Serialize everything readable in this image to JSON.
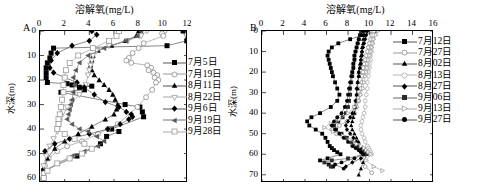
{
  "figure": {
    "background": "#ffffff",
    "axis_color": "#000000"
  },
  "panels": [
    {
      "id": "A",
      "letter": "A",
      "title": "溶解氧(mg/L)",
      "xlabel": "",
      "ylabel": "水深(m)",
      "xticks": [
        0,
        2,
        4,
        6,
        8,
        10,
        12
      ],
      "yticks": [
        0,
        10,
        20,
        30,
        40,
        50,
        60
      ],
      "xlim": [
        0,
        12
      ],
      "ylim": [
        0,
        62
      ],
      "legend_labels": [
        "7月5日",
        "7月19日",
        "8月11日",
        "8月22日",
        "9月6日",
        "9月19日",
        "9月28日"
      ]
    },
    {
      "id": "B",
      "letter": "B",
      "title": "溶解氧(mg/L)",
      "xlabel": "",
      "ylabel": "水深(m)",
      "xticks": [
        0,
        2,
        4,
        6,
        8,
        10,
        12,
        14,
        16
      ],
      "yticks": [
        0,
        10,
        20,
        30,
        40,
        50,
        60,
        70
      ],
      "xlim": [
        0,
        16
      ],
      "ylim": [
        0,
        74
      ],
      "legend_labels": [
        "7月12日",
        "7月27日",
        "8月02日",
        "8月13日",
        "8月27日",
        "9月06日",
        "9月13日",
        "9月27日"
      ]
    }
  ],
  "chart_data": [
    {
      "type": "line",
      "panel": "A",
      "title": "溶解氧(mg/L)",
      "xlabel": "溶解氧(mg/L)",
      "ylabel": "水深(m)",
      "xlim": [
        0,
        12
      ],
      "ylim": [
        0,
        62
      ],
      "y_inverted": true,
      "grid": false,
      "legend_position": "right-inside",
      "series": [
        {
          "name": "7月5日",
          "marker": "filled-square",
          "color": "#000000",
          "line_color": "#555555",
          "x": [
            11.6,
            11.9,
            10.3,
            1.1,
            0.9,
            0.8,
            0.6,
            0.5,
            0.5,
            0.5,
            0.6,
            2.2,
            2.6,
            4.2,
            3.2,
            3.6,
            1.7,
            6.9,
            8.1,
            8.3,
            8.4,
            5.8,
            6.4,
            5.4,
            4.9,
            3.0,
            0.3,
            0.3
          ],
          "y": [
            0,
            4,
            6,
            7,
            9,
            11,
            13,
            15,
            17,
            19,
            21,
            21.5,
            22,
            22.5,
            23,
            24,
            25,
            30,
            31,
            33,
            35,
            40,
            41,
            43,
            46,
            51,
            57,
            60
          ]
        },
        {
          "name": "7月19日",
          "marker": "open-circle",
          "color": "#8a8a8a",
          "line_color": "#9a9a9a",
          "x": [
            10.1,
            9.9,
            10.0,
            8.4,
            8.0,
            7.5,
            7.2,
            7.0,
            7.4,
            8.7,
            9.0,
            8.8,
            9.2,
            9.5,
            9.3,
            9.6,
            9.4,
            9.1,
            8.6,
            7.9,
            6.3,
            5.5,
            4.7,
            3.4,
            2.2,
            1.4,
            0.7,
            0.4,
            0.3
          ],
          "y": [
            0,
            1,
            2,
            5,
            7,
            9,
            11,
            12,
            13,
            14,
            15,
            16,
            17,
            18,
            19,
            20,
            21,
            24,
            27,
            31,
            38,
            40,
            42,
            45,
            47,
            49,
            52,
            55,
            58
          ]
        },
        {
          "name": "8月11日",
          "marker": "filled-triangle",
          "color": "#000000",
          "line_color": "#555555",
          "x": [
            8.0,
            7.8,
            6.9,
            5.8,
            4.7,
            4.3,
            4.2,
            4.1,
            4.2,
            4.4,
            4.8,
            5.2,
            5.6,
            5.9,
            6.1,
            6.3,
            6.2,
            6.0,
            5.3,
            4.2,
            3.1,
            2.0,
            1.2,
            0.6,
            0.3
          ],
          "y": [
            0,
            2,
            4,
            6,
            8,
            10,
            12,
            14,
            16,
            18,
            20,
            22,
            24,
            26,
            28,
            30,
            32,
            34,
            36,
            39,
            42,
            45,
            48,
            52,
            56
          ]
        },
        {
          "name": "8月22日",
          "marker": "open-triangle-down",
          "color": "#9a9a9a",
          "line_color": "#a5a5a5",
          "x": [
            8.7,
            8.2,
            7.1,
            5.6,
            4.6,
            4.3,
            4.2,
            4.1,
            4.0,
            3.9,
            3.7,
            3.2,
            2.6,
            2.2,
            1.9,
            1.7,
            1.6,
            1.5,
            1.4,
            1.1,
            0.8,
            0.5,
            0.3
          ],
          "y": [
            0,
            2,
            4,
            6,
            8,
            10,
            12,
            14,
            16,
            18,
            22,
            26,
            29,
            31,
            33,
            35,
            37,
            39,
            41,
            44,
            47,
            51,
            55
          ]
        },
        {
          "name": "9月6日",
          "marker": "filled-diamond",
          "color": "#000000",
          "line_color": "#555555",
          "x": [
            4.2,
            4.6,
            4.0,
            2.6,
            1.4,
            0.9,
            0.8,
            1.1,
            2.0,
            3.0,
            3.6,
            4.4,
            5.3,
            6.4,
            7.0,
            7.4,
            7.5,
            7.2,
            6.5,
            5.5,
            4.0,
            2.4,
            1.2,
            0.4
          ],
          "y": [
            0,
            1.5,
            4,
            6,
            9,
            12,
            15,
            17,
            19,
            21,
            23,
            26,
            29,
            31,
            33,
            34,
            35,
            36,
            38,
            40,
            42,
            44,
            46,
            49
          ]
        },
        {
          "name": "9月19日",
          "marker": "filled-triangle-left",
          "color": "#5a5a5a",
          "line_color": "#777777",
          "x": [
            8.2,
            7.9,
            7.0,
            5.2,
            3.9,
            3.2,
            2.9,
            2.7,
            2.8,
            2.7,
            2.6,
            2.5,
            2.4,
            2.3,
            2.2,
            2.6,
            3.2,
            3.9,
            4.6,
            5.2,
            4.7,
            3.6,
            2.6,
            1.4,
            0.5
          ],
          "y": [
            0,
            2,
            4,
            7,
            10,
            13,
            16,
            19,
            22,
            25,
            28,
            30,
            32,
            34,
            36,
            38,
            40,
            41,
            43,
            45,
            47,
            49,
            51,
            54,
            57
          ]
        },
        {
          "name": "9月28日",
          "marker": "open-square",
          "color": "#9a9a9a",
          "line_color": "#a5a5a5",
          "x": [
            6.4,
            6.2,
            5.6,
            4.3,
            3.1,
            2.4,
            2.1,
            2.0,
            1.9,
            1.9,
            1.8,
            1.7,
            1.6,
            1.5,
            1.5,
            1.4,
            2.0,
            2.8,
            3.6,
            4.2,
            3.4,
            2.4,
            1.4,
            0.6,
            0.3
          ],
          "y": [
            0,
            2,
            4,
            7,
            10,
            13,
            16,
            19,
            22,
            25,
            28,
            31,
            34,
            36,
            38,
            40,
            42,
            44,
            46,
            48,
            50,
            52,
            54,
            57,
            60
          ]
        }
      ]
    },
    {
      "type": "line",
      "panel": "B",
      "title": "溶解氧(mg/L)",
      "xlabel": "溶解氧(mg/L)",
      "ylabel": "水深(m)",
      "xlim": [
        0,
        16
      ],
      "ylim": [
        0,
        74
      ],
      "y_inverted": true,
      "grid": false,
      "legend_position": "right-inside",
      "series": [
        {
          "name": "7月12日",
          "marker": "filled-square",
          "color": "#000000",
          "line_color": "#555555",
          "x": [
            10.6,
            9.4,
            8.2,
            7.1,
            6.5,
            6.2,
            6.1,
            6.2,
            6.3,
            6.4,
            6.5,
            6.6,
            6.8,
            7.0,
            7.2,
            7.0,
            6.4,
            5.4,
            4.6,
            4.2,
            4.4,
            5.0,
            5.6,
            5.9,
            6.1,
            6.3,
            6.5,
            6.7,
            7.0,
            7.3,
            6.1,
            5.4,
            6.2,
            6.6
          ],
          "y": [
            0,
            2,
            4,
            6,
            8,
            10,
            12,
            14,
            16,
            18,
            20,
            22,
            25,
            28,
            31,
            34,
            37,
            40,
            42,
            44,
            46,
            48,
            50,
            52,
            54,
            56,
            57,
            58,
            59,
            60,
            62,
            63,
            65,
            66
          ]
        },
        {
          "name": "7月27日",
          "marker": "open-circle",
          "color": "#8a8a8a",
          "line_color": "#9a9a9a",
          "x": [
            10.3,
            10.2,
            10.1,
            10.0,
            9.9,
            9.8,
            9.7,
            9.6,
            9.5,
            9.4,
            9.4,
            9.3,
            9.3,
            9.2,
            9.1,
            9.0,
            8.8,
            8.6,
            8.3,
            7.9,
            7.2,
            6.5,
            6.9,
            7.8,
            8.4,
            8.8,
            9.2,
            9.4,
            9.6,
            9.5,
            9.3,
            9.6,
            10.2
          ],
          "y": [
            0,
            2,
            4,
            6,
            8,
            10,
            12,
            14,
            16,
            18,
            20,
            22,
            25,
            28,
            31,
            34,
            37,
            40,
            42,
            44,
            46,
            48,
            50,
            52,
            54,
            56,
            57,
            58,
            59,
            60,
            63,
            66,
            69
          ]
        },
        {
          "name": "8月02日",
          "marker": "filled-triangle",
          "color": "#000000",
          "line_color": "#555555",
          "x": [
            9.6,
            9.5,
            9.4,
            9.4,
            9.3,
            9.3,
            9.2,
            9.2,
            9.1,
            9.1,
            9.0,
            9.0,
            8.9,
            8.9,
            8.8,
            8.8,
            8.7,
            8.6,
            8.5,
            8.4,
            8.3,
            8.4,
            8.6,
            8.8,
            9.0,
            9.1,
            9.2,
            9.4,
            9.6,
            9.8,
            9.4,
            9.2,
            9.0
          ],
          "y": [
            0,
            2,
            4,
            6,
            8,
            10,
            12,
            14,
            16,
            18,
            20,
            22,
            25,
            28,
            31,
            34,
            37,
            40,
            42,
            44,
            46,
            48,
            50,
            52,
            54,
            56,
            57,
            58,
            59,
            60,
            64,
            67,
            70
          ]
        },
        {
          "name": "8月13日",
          "marker": "open-circle-light",
          "color": "#b0b0b0",
          "line_color": "#b5b5b5",
          "x": [
            10.4,
            10.4,
            10.3,
            10.3,
            10.2,
            10.2,
            10.1,
            10.1,
            10.0,
            10.0,
            9.9,
            9.9,
            9.8,
            9.8,
            9.7,
            9.6,
            9.6,
            9.5,
            9.4,
            9.3,
            9.2,
            9.2,
            9.3,
            9.5,
            9.6,
            9.8,
            9.9,
            10.0,
            10.1,
            10.2
          ],
          "y": [
            0,
            2,
            4,
            6,
            8,
            10,
            12,
            14,
            16,
            18,
            20,
            22,
            25,
            28,
            31,
            34,
            37,
            40,
            42,
            44,
            46,
            48,
            50,
            52,
            54,
            56,
            57,
            58,
            59,
            60
          ]
        },
        {
          "name": "8月27日",
          "marker": "filled-diamond",
          "color": "#000000",
          "line_color": "#555555",
          "x": [
            9.8,
            9.7,
            9.6,
            9.5,
            9.4,
            9.3,
            9.3,
            9.2,
            9.2,
            9.1,
            9.0,
            9.0,
            8.9,
            8.8,
            8.8,
            8.7,
            8.6,
            8.4,
            8.2,
            8.0,
            7.8,
            7.9,
            8.2,
            8.5,
            8.8,
            9.0,
            9.2,
            9.4,
            9.6,
            9.2,
            8.4,
            7.8
          ],
          "y": [
            0,
            2,
            4,
            6,
            8,
            10,
            12,
            14,
            16,
            18,
            20,
            22,
            25,
            28,
            31,
            34,
            37,
            40,
            42,
            44,
            46,
            48,
            50,
            52,
            54,
            56,
            57,
            58,
            60,
            62,
            64,
            66
          ]
        },
        {
          "name": "9月06日",
          "marker": "filled-square-sm",
          "color": "#2a2a2a",
          "line_color": "#666666",
          "x": [
            9.2,
            9.1,
            9.0,
            8.9,
            8.8,
            8.7,
            8.6,
            8.6,
            8.5,
            8.5,
            8.4,
            8.4,
            8.3,
            8.2,
            8.2,
            8.1,
            8.0,
            7.8,
            7.5,
            7.1,
            6.7,
            6.9,
            7.4,
            7.9,
            8.3,
            8.6,
            8.9,
            9.1,
            9.3,
            9.5,
            8.0,
            6.5,
            5.8,
            6.4
          ],
          "y": [
            0,
            2,
            4,
            6,
            8,
            10,
            12,
            14,
            16,
            18,
            20,
            22,
            25,
            28,
            31,
            34,
            37,
            40,
            42,
            44,
            46,
            48,
            50,
            52,
            54,
            56,
            57,
            58,
            59,
            60,
            62,
            63,
            64,
            66
          ]
        },
        {
          "name": "9月13日",
          "marker": "open-triangle-right",
          "color": "#a0a0a0",
          "line_color": "#aaaaaa",
          "x": [
            10.8,
            10.6,
            10.4,
            10.3,
            10.2,
            10.1,
            10.0,
            9.9,
            9.8,
            9.8,
            9.7,
            9.6,
            9.5,
            9.4,
            9.2,
            9.0,
            8.6,
            8.0,
            7.2,
            6.4,
            5.8,
            6.6,
            7.5,
            8.2,
            8.8,
            9.2,
            9.5,
            9.7,
            9.9,
            10.1,
            9.7,
            10.4,
            11.2
          ],
          "y": [
            0,
            2,
            4,
            6,
            8,
            10,
            12,
            14,
            16,
            18,
            20,
            22,
            25,
            28,
            31,
            34,
            37,
            40,
            43,
            45,
            47,
            49,
            51,
            53,
            55,
            56,
            57,
            58,
            59,
            60,
            63,
            66,
            68
          ]
        },
        {
          "name": "9月27日",
          "marker": "filled-circle",
          "color": "#000000",
          "line_color": "#555555",
          "x": [
            9.4,
            9.2,
            9.0,
            8.9,
            8.8,
            8.7,
            8.6,
            8.6,
            8.5,
            8.5,
            8.4,
            8.3,
            8.2,
            8.1,
            8.0,
            7.9,
            7.7,
            7.4,
            7.0,
            6.7,
            6.5,
            6.8,
            7.2,
            7.6,
            8.0,
            8.4,
            8.7,
            9.0,
            9.2,
            9.4,
            8.6,
            7.4,
            6.8,
            7.6
          ],
          "y": [
            0,
            2,
            4,
            6,
            8,
            10,
            12,
            14,
            16,
            18,
            20,
            22,
            25,
            28,
            31,
            34,
            37,
            40,
            42,
            44,
            46,
            48,
            50,
            52,
            54,
            56,
            57,
            58,
            59,
            60,
            62,
            64,
            65,
            67
          ]
        }
      ]
    }
  ]
}
